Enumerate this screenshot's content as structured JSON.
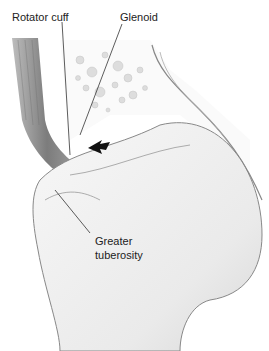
{
  "figure": {
    "labels": {
      "rotator_cuff": "Rotator cuff",
      "glenoid": "Glenoid",
      "greater_tuberosity_line1": "Greater",
      "greater_tuberosity_line2": "tuberosity"
    },
    "arrow": {
      "direction": "left",
      "color": "#111111"
    },
    "colors": {
      "bone_outline": "#777777",
      "muscle": "#8a8a8a",
      "background": "#ffffff"
    }
  }
}
